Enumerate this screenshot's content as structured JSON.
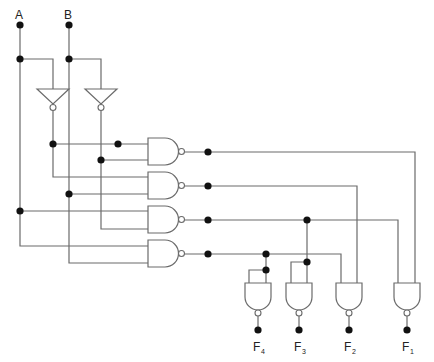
{
  "diagram": {
    "type": "logic-circuit",
    "inputs": [
      {
        "id": "A",
        "label": "A"
      },
      {
        "id": "B",
        "label": "B"
      }
    ],
    "inverters": [
      {
        "id": "inv-a",
        "input": "A",
        "output": "NOT A"
      },
      {
        "id": "inv-b",
        "input": "B",
        "output": "NOT B"
      }
    ],
    "nand_gates": [
      {
        "id": "g1",
        "inputs": [
          "NOT A",
          "NOT B"
        ]
      },
      {
        "id": "g2",
        "inputs": [
          "NOT A",
          "B"
        ]
      },
      {
        "id": "g3",
        "inputs": [
          "A",
          "NOT B"
        ]
      },
      {
        "id": "g4",
        "inputs": [
          "A",
          "B"
        ]
      }
    ],
    "output_gates": [
      {
        "id": "o4",
        "inputs": [
          "g4",
          "g4"
        ]
      },
      {
        "id": "o3",
        "inputs": [
          "g3",
          "g3"
        ]
      },
      {
        "id": "o2",
        "inputs": [
          "g4",
          "g2"
        ]
      },
      {
        "id": "o1",
        "inputs": [
          "g3",
          "g1"
        ]
      }
    ],
    "outputs": [
      {
        "id": "F4",
        "main": "F",
        "sub": "4"
      },
      {
        "id": "F3",
        "main": "F",
        "sub": "3"
      },
      {
        "id": "F2",
        "main": "F",
        "sub": "2"
      },
      {
        "id": "F1",
        "main": "F",
        "sub": "1"
      }
    ]
  }
}
